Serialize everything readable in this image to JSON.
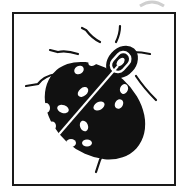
{
  "icon": {
    "name": "ladybug-icon",
    "description": "Black spotted beetle inside a square frame",
    "colors": {
      "body": "#111111",
      "spots": "#ffffff",
      "frame": "#1a1a1a",
      "background": "#ffffff",
      "arc": "#cccccc"
    }
  }
}
